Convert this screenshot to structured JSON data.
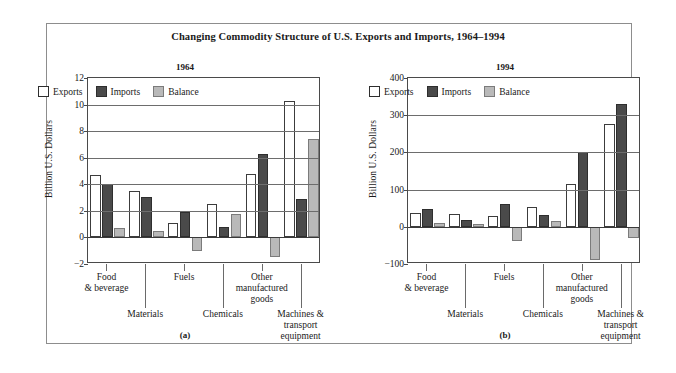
{
  "figure": {
    "title": "Changing Commodity Structure of U.S. Exports and Imports, 1964–1994",
    "panel_a_letter": "(a)",
    "panel_b_letter": "(b)"
  },
  "legend": {
    "exports": "Exports",
    "imports": "Imports",
    "balance": "Balance"
  },
  "colors": {
    "exports": "#ffffff",
    "imports": "#4a4a4a",
    "balance": "#b9b9b9",
    "frame": "#8d8d8d",
    "axis": "#4a4a4a",
    "grid": "#6d6d6d"
  },
  "chart_data": [
    {
      "type": "bar",
      "title": "1964",
      "panel": "(a)",
      "xlabel": "",
      "ylabel": "Billion U.S. Dollars",
      "ylim": [
        -2,
        12
      ],
      "yticks": [
        -2,
        0,
        2,
        4,
        6,
        8,
        10,
        12
      ],
      "ytick_labels": [
        "−2",
        "0",
        "2",
        "4",
        "6",
        "8",
        "10",
        "12"
      ],
      "grid": true,
      "legend_position": "upper-left-inside",
      "categories": [
        "Food & beverage",
        "Materials",
        "Fuels",
        "Chemicals",
        "Other manufactured goods",
        "Machines & transport equipment"
      ],
      "series": [
        {
          "name": "Exports",
          "values": [
            4.7,
            3.5,
            1.05,
            2.5,
            4.75,
            10.3
          ]
        },
        {
          "name": "Imports",
          "values": [
            4.0,
            3.05,
            1.95,
            0.8,
            6.3,
            2.9
          ]
        },
        {
          "name": "Balance",
          "values": [
            0.7,
            0.5,
            -1.0,
            1.75,
            -1.5,
            7.4
          ]
        }
      ]
    },
    {
      "type": "bar",
      "title": "1994",
      "panel": "(b)",
      "xlabel": "",
      "ylabel": "Billion U.S. Dollars",
      "ylim": [
        -100,
        400
      ],
      "yticks": [
        -100,
        0,
        100,
        200,
        300,
        400
      ],
      "ytick_labels": [
        "−100",
        "0",
        "100",
        "200",
        "300",
        "400"
      ],
      "grid": true,
      "legend_position": "upper-left-inside",
      "categories": [
        "Food & beverage",
        "Materials",
        "Fuels",
        "Chemicals",
        "Other manufactured goods",
        "Machines & transport equipment"
      ],
      "series": [
        {
          "name": "Exports",
          "values": [
            38,
            35,
            28,
            52,
            114,
            277
          ]
        },
        {
          "name": "Imports",
          "values": [
            47,
            17,
            61,
            31,
            202,
            330
          ]
        },
        {
          "name": "Balance",
          "values": [
            9,
            7,
            -37,
            15,
            -88,
            -30
          ]
        }
      ]
    }
  ],
  "category_labels": [
    {
      "text": "Food\n& beverage",
      "row": "top"
    },
    {
      "text": "Materials",
      "row": "bottom"
    },
    {
      "text": "Fuels",
      "row": "top"
    },
    {
      "text": "Chemicals",
      "row": "bottom"
    },
    {
      "text": "Other\nmanufactured\ngoods",
      "row": "top"
    },
    {
      "text": "Machines &\ntransport\nequipment",
      "row": "bottom"
    }
  ]
}
